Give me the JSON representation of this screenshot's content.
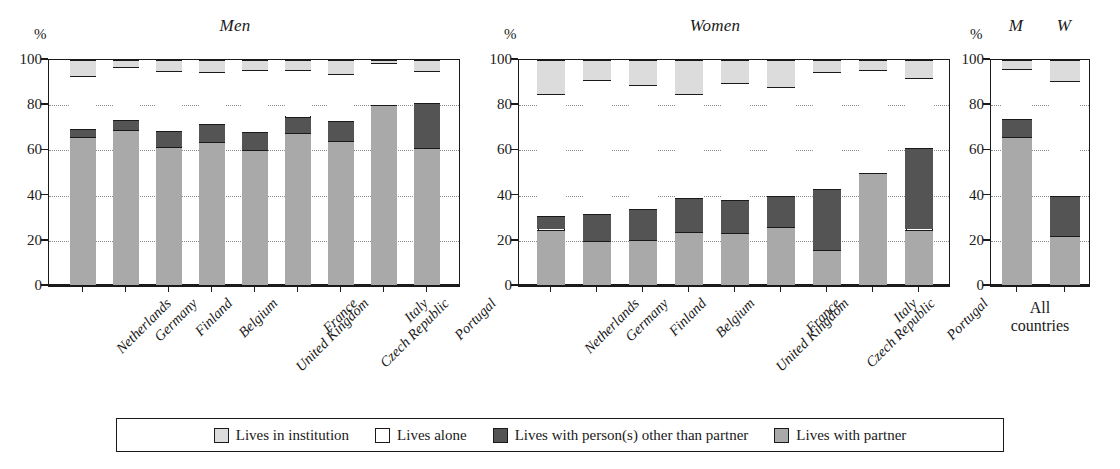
{
  "chart_data": {
    "type": "bar",
    "subtype": "stacked-bar-100pct",
    "title": "",
    "xlabel": "",
    "ylabel": "%",
    "ylim": [
      0,
      100
    ],
    "yticks": [
      0,
      20,
      40,
      60,
      80,
      100
    ],
    "grid": "dotted horizontal gridlines at 20, 40, 60, 80",
    "legend_position": "bottom",
    "stack_order_bottom_to_top": [
      "Lives with partner",
      "Lives with person(s) other than partner",
      "Lives alone",
      "Lives in institution"
    ],
    "series": [
      {
        "name": "Lives with partner",
        "color": "#a9a9a9"
      },
      {
        "name": "Lives with person(s) other than partner",
        "color": "#545454"
      },
      {
        "name": "Lives alone",
        "color": "#ffffff"
      },
      {
        "name": "Lives in institution",
        "color": "#dcdcdc"
      }
    ],
    "panels": [
      {
        "title": "Men",
        "categories": [
          "Netherlands",
          "Germany",
          "Finland",
          "Belgium",
          "United Kingdom",
          "France",
          "Czech Republic",
          "Italy",
          "Portugal"
        ],
        "values": {
          "Lives with partner": [
            66,
            69,
            61.5,
            63.5,
            60,
            67.5,
            64,
            80,
            61
          ],
          "Lives with person(s) other than partner": [
            3.5,
            4.5,
            7,
            8,
            8,
            7.5,
            9,
            0,
            20
          ],
          "Lives alone": [
            23.5,
            23.5,
            26.5,
            23,
            27.5,
            20.5,
            21,
            18.5,
            14
          ],
          "Lives in institution": [
            7,
            3,
            5,
            5.5,
            4.5,
            4.5,
            6,
            1.5,
            5
          ]
        },
        "cumulative_tops": {
          "partner": [
            66,
            69,
            61.5,
            63.5,
            60,
            67.5,
            64,
            80,
            61
          ],
          "other": [
            69.5,
            73.5,
            68.5,
            71.5,
            68,
            75,
            73,
            80,
            81
          ],
          "alone": [
            93,
            97,
            95,
            94.5,
            95.5,
            95.5,
            94,
            98.5,
            95
          ],
          "institution": [
            100,
            100,
            100,
            100,
            100,
            100,
            100,
            100,
            100
          ]
        }
      },
      {
        "title": "Women",
        "categories": [
          "Netherlands",
          "Germany",
          "Finland",
          "Belgium",
          "United Kingdom",
          "France",
          "Czech Republic",
          "Italy",
          "Portugal"
        ],
        "values": {
          "Lives with partner": [
            25,
            20,
            20.5,
            24,
            23.5,
            26,
            16,
            50,
            25
          ],
          "Lives with person(s) other than partner": [
            6,
            12,
            13.5,
            15,
            14.5,
            14,
            27,
            0,
            36
          ],
          "Lives alone": [
            54,
            59,
            55,
            46,
            52,
            48,
            51.5,
            45.5,
            31
          ],
          "Lives in institution": [
            15,
            9,
            11,
            15,
            10,
            12,
            5.5,
            4.5,
            8
          ]
        },
        "cumulative_tops": {
          "partner": [
            25,
            20,
            20.5,
            24,
            23.5,
            26,
            16,
            50,
            25
          ],
          "other": [
            31,
            32,
            34,
            39,
            38,
            40,
            43,
            50,
            61
          ],
          "alone": [
            85,
            91,
            89,
            85,
            90,
            88,
            94.5,
            95.5,
            92
          ],
          "institution": [
            100,
            100,
            100,
            100,
            100,
            100,
            100,
            100,
            100
          ]
        }
      },
      {
        "title": "",
        "group_label": "All\ncountries",
        "group_label_line1": "All",
        "group_label_line2": "countries",
        "categories": [
          "M",
          "W"
        ],
        "values": {
          "Lives with partner": [
            66,
            22
          ],
          "Lives with person(s) other than partner": [
            8,
            18
          ],
          "Lives alone": [
            22,
            50.5
          ],
          "Lives in institution": [
            4,
            9.5
          ]
        },
        "cumulative_tops": {
          "partner": [
            66,
            22
          ],
          "other": [
            74,
            40
          ],
          "alone": [
            96,
            90.5
          ],
          "institution": [
            100,
            100
          ]
        }
      }
    ]
  },
  "axis": {
    "unit_symbol": "%",
    "tick_100": "100",
    "tick_80": "80",
    "tick_60": "60",
    "tick_40": "40",
    "tick_20": "20",
    "tick_0": "0"
  },
  "panel_titles": {
    "men": "Men",
    "women": "Women",
    "all_m": "M",
    "all_w": "W"
  },
  "group_label": {
    "line1": "All",
    "line2": "countries"
  },
  "countries": [
    "Netherlands",
    "Germany",
    "Finland",
    "Belgium",
    "United Kingdom",
    "France",
    "Czech Republic",
    "Italy",
    "Portugal"
  ],
  "legend": {
    "items": [
      {
        "label": "Lives in institution",
        "color": "#dcdcdc",
        "swatch": "inst"
      },
      {
        "label": "Lives alone",
        "color": "#ffffff",
        "swatch": "alone"
      },
      {
        "label": "Lives with person(s) other than partner",
        "color": "#545454",
        "swatch": "other"
      },
      {
        "label": "Lives with partner",
        "color": "#a9a9a9",
        "swatch": "partner"
      }
    ]
  }
}
